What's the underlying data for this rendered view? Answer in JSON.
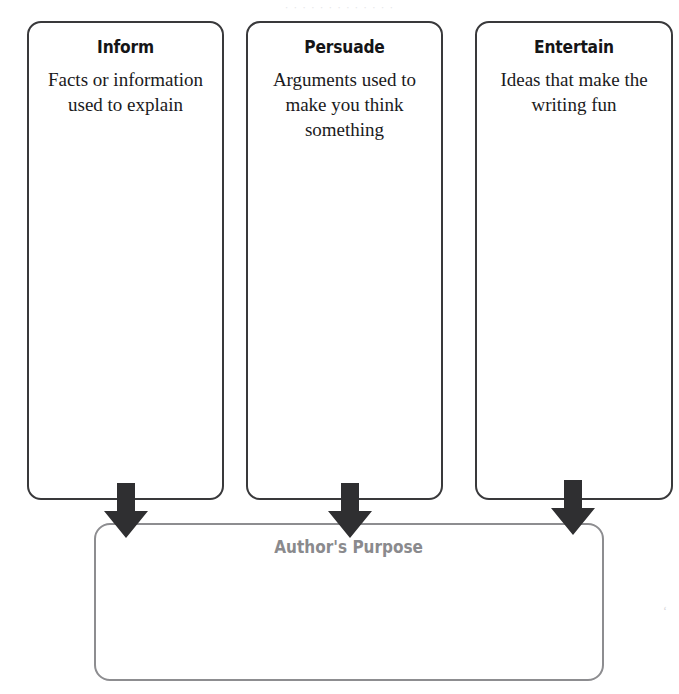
{
  "page": {
    "ghost_text": "· · · ·   · · · ·   · ·   · · ·",
    "background_color": "#ffffff",
    "faint_corner_mark": "ʻ"
  },
  "organizer": {
    "title": "Author's Purpose",
    "title_color": "#8a8a8d",
    "box_border_color": "#39393b",
    "result_border_color": "#8d8d90",
    "arrow_color": "#2f2f31",
    "categories": [
      {
        "name": "inform",
        "title": "Inform",
        "description": "Facts or information used to explain"
      },
      {
        "name": "persuade",
        "title": "Persuade",
        "description": "Arguments used to make you think something"
      },
      {
        "name": "entertain",
        "title": "Entertain",
        "description": "Ideas that make the writing fun"
      }
    ]
  }
}
